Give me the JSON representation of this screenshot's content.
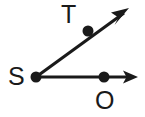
{
  "figure": {
    "kind": "geometry-angle-diagram",
    "background_color": "#ffffff",
    "stroke_color": "#1a1a1a",
    "stroke_width": 3,
    "point_radius": 5,
    "canvas": {
      "width": 145,
      "height": 117
    },
    "vertex": {
      "name": "S",
      "label": "S",
      "x": 36,
      "y": 77,
      "label_x": 8,
      "label_y": 64
    },
    "rays": [
      {
        "name": "ray-ST",
        "from": "S",
        "through_point": "T",
        "start": {
          "x": 36,
          "y": 77
        },
        "end": {
          "x": 128,
          "y": 10
        },
        "arrowhead": true,
        "marked_point": {
          "label": "T",
          "x": 88,
          "y": 31,
          "label_x": 61,
          "label_y": 2
        }
      },
      {
        "name": "ray-SO",
        "from": "S",
        "through_point": "O",
        "start": {
          "x": 36,
          "y": 77
        },
        "end": {
          "x": 138,
          "y": 77
        },
        "arrowhead": true,
        "marked_point": {
          "label": "O",
          "x": 104,
          "y": 77,
          "label_x": 95,
          "label_y": 88
        }
      }
    ],
    "labels": {
      "S": "S",
      "T": "T",
      "O": "O"
    }
  }
}
